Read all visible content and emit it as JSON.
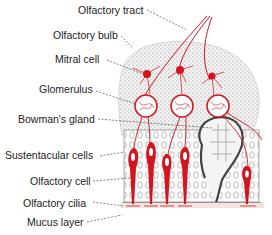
{
  "diagram": {
    "labels": [
      {
        "id": "olfactory-tract",
        "text": "Olfactory tract",
        "x": 78,
        "y": 4
      },
      {
        "id": "olfactory-bulb",
        "text": "Olfactory bulb",
        "x": 53,
        "y": 29
      },
      {
        "id": "mitral-cell",
        "text": "Mitral cell",
        "x": 55,
        "y": 53
      },
      {
        "id": "glomerulus",
        "text": "Glomerulus",
        "x": 39,
        "y": 83
      },
      {
        "id": "bowmans-gland",
        "text": "Bowman's gland",
        "x": 18,
        "y": 113
      },
      {
        "id": "sustentacular-cells",
        "text": "Sustentacular cells",
        "x": 5,
        "y": 149
      },
      {
        "id": "olfactory-cell",
        "text": "Olfactory cell",
        "x": 30,
        "y": 175
      },
      {
        "id": "olfactory-cilia",
        "text": "Olfactory cilia",
        "x": 23,
        "y": 197
      },
      {
        "id": "mucus-layer",
        "text": "Mucus layer",
        "x": 27,
        "y": 216
      }
    ],
    "colors": {
      "nerve": "#d4141e",
      "tissue": "#9a9a9a",
      "outline": "#444444",
      "text": "#222222"
    }
  }
}
